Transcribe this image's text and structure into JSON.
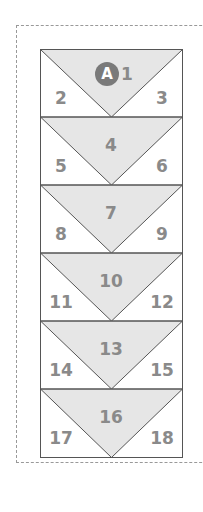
{
  "diagram": {
    "badge_label": "A",
    "colors": {
      "fill": "#e6e6e6",
      "stroke": "#555555",
      "text": "#8a8a8a",
      "badge": "#7a7a7a"
    },
    "rows": [
      {
        "center": "1",
        "left": "2",
        "right": "3"
      },
      {
        "center": "4",
        "left": "5",
        "right": "6"
      },
      {
        "center": "7",
        "left": "8",
        "right": "9"
      },
      {
        "center": "10",
        "left": "11",
        "right": "12"
      },
      {
        "center": "13",
        "left": "14",
        "right": "15"
      },
      {
        "center": "16",
        "left": "17",
        "right": "18"
      }
    ]
  }
}
